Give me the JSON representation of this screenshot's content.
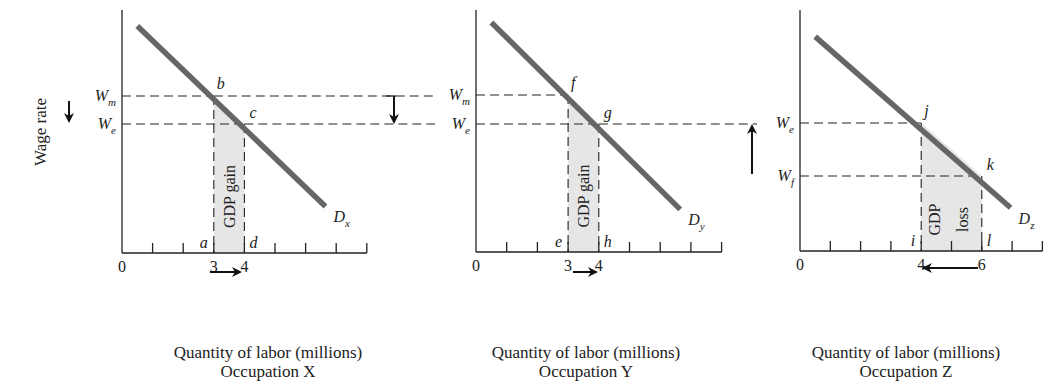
{
  "y_axis_label": "Wage rate",
  "chart_data": [
    {
      "type": "line",
      "title": "Occupation X",
      "xlabel": "Quantity of labor (millions)",
      "ylabel": "Wage rate",
      "xlim": [
        0,
        8
      ],
      "x_ticks": [
        0,
        1,
        2,
        3,
        4,
        5,
        6,
        7,
        8
      ],
      "x_tick_labels": [
        {
          "x": 0,
          "label": "0"
        },
        {
          "x": 3,
          "label": "3"
        },
        {
          "x": 4,
          "label": "4"
        }
      ],
      "demand_curve": {
        "name": "D",
        "subscript": "x",
        "from": [
          0.5,
          7.5
        ],
        "to": [
          6.65,
          1.7
        ]
      },
      "wage_levels": [
        {
          "name": "W",
          "subscript": "m",
          "y": 5.25
        },
        {
          "name": "W",
          "subscript": "e",
          "y": 4.35
        }
      ],
      "points": [
        {
          "label": "b",
          "x": 3,
          "y": 5.25
        },
        {
          "label": "c",
          "x": 4,
          "y": 4.35
        },
        {
          "label": "a",
          "x": 3,
          "y": 0
        },
        {
          "label": "d",
          "x": 4,
          "y": 0
        }
      ],
      "shaded_area": {
        "label": "GDP gain",
        "x_from": 3,
        "x_to": 4
      },
      "quantity_arrow": "right",
      "wage_arrow": "down"
    },
    {
      "type": "line",
      "title": "Occupation Y",
      "xlabel": "Quantity of labor (millions)",
      "xlim": [
        0,
        8
      ],
      "x_ticks": [
        0,
        1,
        2,
        3,
        4,
        5,
        6,
        7,
        8
      ],
      "x_tick_labels": [
        {
          "x": 0,
          "label": "0"
        },
        {
          "x": 3,
          "label": "3"
        },
        {
          "x": 4,
          "label": "4"
        }
      ],
      "demand_curve": {
        "name": "D",
        "subscript": "y",
        "from": [
          0.5,
          7.5
        ],
        "to": [
          6.65,
          1.7
        ]
      },
      "wage_levels": [
        {
          "name": "W",
          "subscript": "m",
          "y": 5.25
        },
        {
          "name": "W",
          "subscript": "e",
          "y": 4.35
        }
      ],
      "points": [
        {
          "label": "f",
          "x": 3,
          "y": 5.25
        },
        {
          "label": "g",
          "x": 4,
          "y": 4.35
        },
        {
          "label": "e",
          "x": 3,
          "y": 0
        },
        {
          "label": "h",
          "x": 4,
          "y": 0
        }
      ],
      "shaded_area": {
        "label": "GDP gain",
        "x_from": 3,
        "x_to": 4
      },
      "quantity_arrow": "right",
      "wage_arrow": "down"
    },
    {
      "type": "line",
      "title": "Occupation Z",
      "xlabel": "Quantity of labor (millions)",
      "xlim": [
        0,
        8
      ],
      "x_ticks": [
        0,
        1,
        2,
        3,
        4,
        5,
        6,
        7,
        8
      ],
      "x_tick_labels": [
        {
          "x": 0,
          "label": "0"
        },
        {
          "x": 4,
          "label": "4"
        },
        {
          "x": 6,
          "label": "6"
        }
      ],
      "demand_curve": {
        "name": "D",
        "subscript": "z",
        "from": [
          0.5,
          7.2
        ],
        "to": [
          6.95,
          1.55
        ]
      },
      "wage_levels": [
        {
          "name": "W",
          "subscript": "e",
          "y": 4.35
        },
        {
          "name": "W",
          "subscript": "f",
          "y": 2.6
        }
      ],
      "points": [
        {
          "label": "j",
          "x": 4,
          "y": 4.35
        },
        {
          "label": "k",
          "x": 6,
          "y": 2.6
        },
        {
          "label": "i",
          "x": 4,
          "y": 0
        },
        {
          "label": "l",
          "x": 6,
          "y": 0
        }
      ],
      "shaded_area": {
        "label_lines": [
          "GDP",
          "loss"
        ],
        "x_from": 4,
        "x_to": 6
      },
      "quantity_arrow": "left",
      "wage_arrow": "up"
    }
  ]
}
